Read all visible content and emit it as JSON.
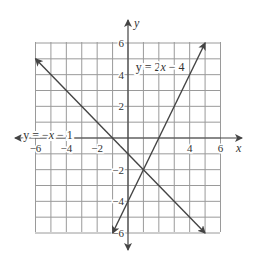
{
  "chart_data": {
    "type": "line",
    "title": "",
    "xlabel": "x",
    "ylabel": "y",
    "xlim": [
      -6,
      6
    ],
    "ylim": [
      -6,
      6
    ],
    "grid": true,
    "x_ticks": [
      -6,
      -4,
      -2,
      4,
      6
    ],
    "y_ticks": [
      6,
      4,
      2,
      -2,
      -4,
      -6
    ],
    "x_tick_labels": [
      "−6",
      "−4",
      "−2",
      "4",
      "6"
    ],
    "y_tick_labels": [
      "6",
      "4",
      "2",
      "−2",
      "−4",
      "−6"
    ],
    "series": [
      {
        "name": "y = −x − 1",
        "equation": "y = -x - 1",
        "slope": -1,
        "intercept": -1,
        "x": [
          -6,
          5
        ],
        "y": [
          5,
          -6
        ],
        "label_position": [
          -6.8,
          0.2
        ]
      },
      {
        "name": "y = 2x − 4",
        "equation": "y = 2x - 4",
        "slope": 2,
        "intercept": -4,
        "x": [
          -1,
          5
        ],
        "y": [
          -6,
          6
        ],
        "label_position": [
          0.5,
          4.5
        ]
      }
    ],
    "intersection": [
      1,
      -2
    ],
    "legend": "inline labels"
  },
  "labels": {
    "x_axis": "x",
    "y_axis": "y",
    "line1": {
      "pre": "y = −",
      "var": "x",
      "post": " − 1"
    },
    "line2": {
      "pre": "y = 2",
      "var": "x",
      "post": " − 4"
    }
  }
}
